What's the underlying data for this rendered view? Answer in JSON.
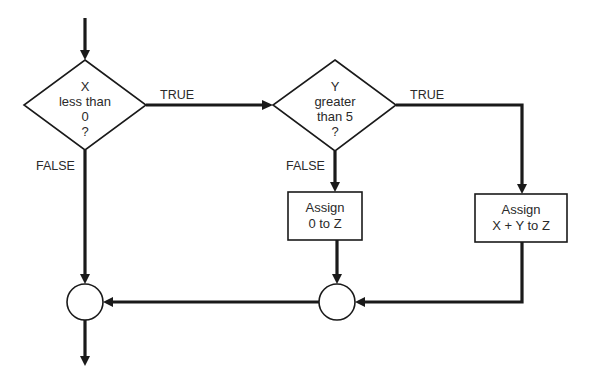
{
  "diagram": {
    "type": "flowchart",
    "colors": {
      "stroke": "#1a1a1a",
      "text": "#2a2a2a",
      "background": "#ffffff"
    },
    "nodes": {
      "decision_x": {
        "shape": "diamond",
        "lines": [
          "X",
          "less than",
          "0",
          "?"
        ]
      },
      "decision_y": {
        "shape": "diamond",
        "lines": [
          "Y",
          "greater",
          "than 5",
          "?"
        ]
      },
      "assign_zero": {
        "shape": "rectangle",
        "lines": [
          "Assign",
          "0 to Z"
        ]
      },
      "assign_sum": {
        "shape": "rectangle",
        "lines": [
          "Assign",
          "X + Y to Z"
        ]
      },
      "join_left": {
        "shape": "circle"
      },
      "join_right": {
        "shape": "circle"
      }
    },
    "edges": [
      {
        "from": "start",
        "to": "decision_x",
        "label": ""
      },
      {
        "from": "decision_x",
        "to": "decision_y",
        "label": "TRUE"
      },
      {
        "from": "decision_x",
        "to": "join_left",
        "label": "FALSE"
      },
      {
        "from": "decision_y",
        "to": "assign_sum",
        "label": "TRUE"
      },
      {
        "from": "decision_y",
        "to": "assign_zero",
        "label": "FALSE"
      },
      {
        "from": "assign_zero",
        "to": "join_right",
        "label": ""
      },
      {
        "from": "assign_sum",
        "to": "join_right",
        "label": ""
      },
      {
        "from": "join_right",
        "to": "join_left",
        "label": ""
      },
      {
        "from": "join_left",
        "to": "end",
        "label": ""
      }
    ],
    "labels": {
      "x_true": "TRUE",
      "x_false": "FALSE",
      "y_true": "TRUE",
      "y_false": "FALSE"
    }
  }
}
